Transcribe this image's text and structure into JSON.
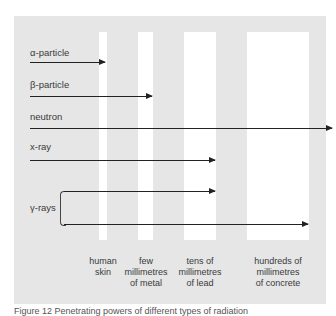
{
  "diagram": {
    "radiation": [
      {
        "label": "α-particle",
        "stops_at": "human skin"
      },
      {
        "label": "β-particle",
        "stops_at": "few millimetres of metal"
      },
      {
        "label": "neutron",
        "stops_at": "passes through all"
      },
      {
        "label": "x-ray",
        "stops_at": "tens of millimetres of lead"
      },
      {
        "label": "γ-rays",
        "stops_at": [
          "tens of millimetres of lead",
          "hundreds of millimetres of concrete"
        ]
      }
    ],
    "barriers": [
      {
        "line1": "human",
        "line2": "skin",
        "line3": ""
      },
      {
        "line1": "few",
        "line2": "millimetres",
        "line3": "of metal"
      },
      {
        "line1": "tens of",
        "line2": "millimetres",
        "line3": "of lead"
      },
      {
        "line1": "hundreds of",
        "line2": "millimetres",
        "line3": "of concrete"
      }
    ],
    "caption": "Figure 12  Penetrating powers of different types of radiation",
    "colors": {
      "panel": "#e6e6e6",
      "barrier": "#ffffff",
      "arrow": "#222222"
    }
  }
}
